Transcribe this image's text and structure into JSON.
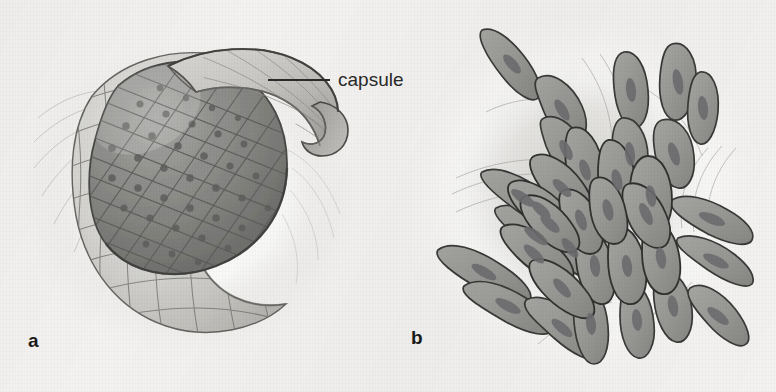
{
  "figure": {
    "kind": "scientific-illustration",
    "medium": "pencil and wash drawing",
    "background_color": "#f3f2f0",
    "ink_color": "#2a2a2a",
    "panel_count": 2
  },
  "annotations": {
    "capsule_label": "capsule"
  },
  "panels": [
    {
      "id": "a",
      "label": "a",
      "title": "Encapsulated cell mass with capsule peeled back",
      "elements": {
        "capsule_flap": "capsule",
        "inner_mass": "tumour cell mass",
        "capsule_wall": "fibrous capsule wall"
      },
      "colors": {
        "inner_mass_fill": "#8c8c8a",
        "inner_mass_shadow": "#6e6e6c",
        "capsule_fill": "#d4d3cf",
        "capsule_shadow": "#a9a8a4",
        "outline": "#4f4f4d",
        "halo": "#fbfbfa"
      }
    },
    {
      "id": "b",
      "label": "b",
      "title": "Uncapsulated cell mass with cells invading surrounding tissue",
      "elements": {
        "cell_cluster": "invasive cell mass",
        "radiating_cells": "spindle-shaped invading cells",
        "stroma_fibres": "surrounding connective tissue fibres"
      },
      "colors": {
        "cell_fill": "#9b9b99",
        "nucleus_fill": "#76767a",
        "outline": "#3c3c3c",
        "stroma": "#d8d8d4",
        "halo": "#fbfbfa"
      }
    }
  ]
}
